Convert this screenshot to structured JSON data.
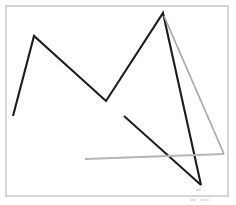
{
  "figure": {
    "width": 236,
    "height": 205,
    "background_color": "#ffffff",
    "frame": {
      "name": "page-border",
      "x": 6,
      "y": 6,
      "width": 222,
      "height": 190,
      "stroke_color": "#c4c4c4",
      "stroke_width": 1.4
    },
    "colors": {
      "dark_stroke": "#1c1c1c",
      "gray_stroke": "#a8a8a8",
      "light_gray_stroke": "#b5b5b5",
      "frame_stroke": "#c4c4c4",
      "background": "#ffffff"
    }
  },
  "chart_data": {
    "type": "line",
    "subtitle": "",
    "xlabel": "",
    "ylabel": "",
    "xlim": [
      0,
      236
    ],
    "ylim": [
      205,
      0
    ],
    "grid": false,
    "legend": "none",
    "tick_labels": {
      "x": [],
      "y": []
    },
    "annotations": [],
    "series": [
      {
        "name": "main-zigzag",
        "color": "#1c1c1c",
        "width": 2.1,
        "closed": false,
        "points": [
          [
            13,
            116
          ],
          [
            34,
            36
          ],
          [
            106,
            101
          ],
          [
            163,
            13
          ],
          [
            201,
            185
          ]
        ]
      },
      {
        "name": "lower-dark-diagonal",
        "color": "#1c1c1c",
        "width": 2.0,
        "closed": false,
        "points": [
          [
            124,
            116
          ],
          [
            201,
            185
          ]
        ]
      },
      {
        "name": "gray-descending-diagonal",
        "color": "#a8a8a8",
        "width": 1.7,
        "closed": false,
        "points": [
          [
            164,
            16
          ],
          [
            224,
            154
          ]
        ]
      },
      {
        "name": "gray-horizontal-baseline",
        "color": "#b5b5b5",
        "width": 1.8,
        "closed": false,
        "points": [
          [
            85,
            159
          ],
          [
            224,
            154
          ]
        ]
      }
    ]
  },
  "artifacts": [
    {
      "name": "scan-speck-upper",
      "x": 196,
      "y": 189,
      "width": 5,
      "height": 2
    },
    {
      "name": "scan-speck-lower-left",
      "x": 190,
      "y": 199,
      "width": 6,
      "height": 2
    },
    {
      "name": "scan-speck-lower-right",
      "x": 201,
      "y": 199,
      "width": 8,
      "height": 2
    }
  ]
}
